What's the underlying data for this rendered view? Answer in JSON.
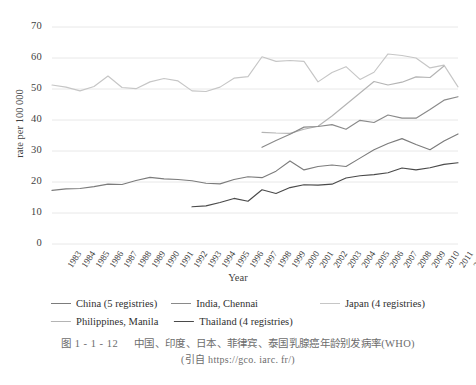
{
  "chart_data": {
    "type": "line",
    "title": "",
    "xlabel": "Year",
    "ylabel": "rate per 100 000",
    "ylim": [
      0,
      70
    ],
    "yticks": [
      0,
      10,
      20,
      30,
      40,
      50,
      60,
      70
    ],
    "grid": "horizontal",
    "legend_position": "bottom",
    "x": [
      1983,
      1984,
      1985,
      1986,
      1987,
      1988,
      1989,
      1990,
      1991,
      1992,
      1993,
      1994,
      1995,
      1996,
      1997,
      1998,
      1999,
      2000,
      2001,
      2002,
      2003,
      2004,
      2005,
      2006,
      2007,
      2008,
      2009,
      2010,
      2011,
      2012
    ],
    "categories": [
      "1983",
      "1984",
      "1985",
      "1986",
      "1987",
      "1988",
      "1989",
      "1990",
      "1991",
      "1992",
      "1993",
      "1994",
      "1995",
      "1996",
      "1997",
      "1998",
      "1999",
      "2000",
      "2001",
      "2002",
      "2003",
      "2004",
      "2005",
      "2006",
      "2007",
      "2008",
      "2009",
      "2010",
      "2011",
      "2012"
    ],
    "series": [
      {
        "name": "Japan (4 registries)",
        "color": "#c6c6c6",
        "start_year": 1983,
        "values": [
          51.3,
          50.6,
          49.4,
          50.8,
          54.2,
          50.5,
          50.1,
          52.3,
          53.4,
          52.6,
          49.4,
          49.2,
          50.6,
          53.5,
          54.0,
          60.4,
          58.9,
          59.2,
          58.9,
          52.3,
          55.3,
          57.2,
          53.1,
          55.4,
          61.3,
          60.8,
          60.0,
          56.8,
          57.7,
          50.7
        ]
      },
      {
        "name": "Philippines, Manila",
        "color": "#b4b4b4",
        "start_year": 1998,
        "values": [
          null,
          null,
          null,
          null,
          null,
          null,
          null,
          null,
          null,
          null,
          null,
          null,
          null,
          null,
          null,
          36.0,
          35.8,
          35.7,
          37.0,
          38.0,
          41.3,
          45.0,
          48.7,
          52.4,
          51.3,
          52.2,
          53.9,
          53.7,
          57.4,
          null
        ]
      },
      {
        "name": "India, Chennai",
        "color": "#8a8a8a",
        "start_year": 1998,
        "values": [
          null,
          null,
          null,
          null,
          null,
          null,
          null,
          null,
          null,
          null,
          null,
          null,
          null,
          null,
          null,
          31.2,
          33.4,
          35.4,
          37.7,
          37.9,
          38.5,
          37.0,
          39.9,
          39.2,
          41.6,
          40.6,
          40.6,
          43.4,
          46.4,
          47.5
        ]
      },
      {
        "name": "China (5 registries)",
        "color": "#7c7c7c",
        "start_year": 1983,
        "values": [
          17.3,
          17.8,
          17.9,
          18.5,
          19.3,
          19.2,
          20.5,
          21.5,
          21.0,
          20.8,
          20.4,
          19.6,
          19.4,
          20.8,
          21.7,
          21.4,
          23.5,
          26.8,
          23.9,
          25.0,
          25.5,
          25.0,
          27.7,
          30.4,
          32.4,
          34.0,
          32.1,
          30.4,
          33.2,
          35.5
        ]
      },
      {
        "name": "Thailand (4 registries)",
        "color": "#4a4a4a",
        "start_year": 1993,
        "values": [
          null,
          null,
          null,
          null,
          null,
          null,
          null,
          null,
          null,
          null,
          12.0,
          12.3,
          13.4,
          14.7,
          13.8,
          17.5,
          16.3,
          18.2,
          19.1,
          19.0,
          19.3,
          21.3,
          22.0,
          22.4,
          23.0,
          24.5,
          23.9,
          24.6,
          25.7,
          26.2
        ]
      }
    ]
  },
  "axis": {
    "y_title": "rate per 100 000",
    "x_title": "Year",
    "y_tick_labels": [
      "70",
      "60",
      "50",
      "40",
      "30",
      "20",
      "10",
      "0"
    ]
  },
  "legend": {
    "row1": [
      {
        "label": "China (5 registries)",
        "color": "#7c7c7c"
      },
      {
        "label": "India, Chennai",
        "color": "#8a8a8a"
      },
      {
        "label": "Japan (4 registries)",
        "color": "#c6c6c6"
      }
    ],
    "row2": [
      {
        "label": "Philippines, Manila",
        "color": "#b4b4b4"
      },
      {
        "label": "Thailand (4 registries)",
        "color": "#4a4a4a"
      }
    ]
  },
  "caption": {
    "figure_number": "图 1 - 1 - 12",
    "title": "中国、印度、日本、菲律宾、泰国乳腺癌年龄别发病率(WHO)",
    "source": "(引自 https://gco. iarc. fr/)"
  }
}
